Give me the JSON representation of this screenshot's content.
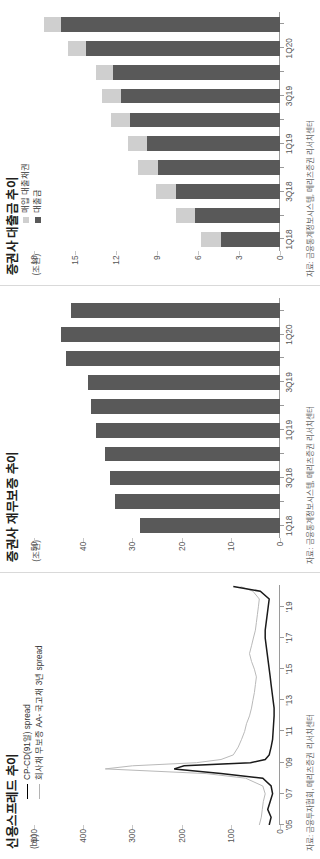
{
  "figure": {
    "orientation": "rotated-90-ccw",
    "colors": {
      "dark_bar": "#595959",
      "light_bar": "#cfcfcf",
      "line_dark": "#1a1a1a",
      "line_light": "#b9b9b9",
      "axis": "#9a9a9a",
      "text": "#231f20"
    }
  },
  "panels": [
    {
      "title": "신용스프레드 추이",
      "unit": "(bp)",
      "source": "자료: 금융투자협회, 메리츠증권 리서치센터",
      "legend": [
        {
          "label": "CP-CD(91일) spread",
          "style": "line-dark"
        },
        {
          "label": "회사채 무보증 AA- 국고채 3년 spread",
          "style": "line-light"
        }
      ]
    },
    {
      "title": "증권사 재무보증 추이",
      "unit": "(조원)",
      "source": "자료: 금융통계정보시스템, 메리츠증권 리서치센터",
      "legend": []
    },
    {
      "title": "증권사 대출금 추이",
      "unit": "(조원)",
      "source": "자료: 금융통계정보시스템, 메리츠증권 리서치센터",
      "legend": [
        {
          "label": "매입 대출채권",
          "style": "sq-light"
        },
        {
          "label": "대출금",
          "style": "sq-dark"
        }
      ]
    }
  ],
  "chart_data": [
    {
      "type": "line",
      "title": "신용스프레드 추이",
      "xlabel": "",
      "ylabel": "bp",
      "ylim": [
        0,
        500
      ],
      "yticks": [
        0,
        100,
        200,
        300,
        400,
        500
      ],
      "xticks": [
        "'05",
        "'07",
        "'09",
        "'11",
        "'13",
        "'15",
        "'17",
        "'19"
      ],
      "grid": false,
      "legend_position": "top-left",
      "x": [
        2005.0,
        2005.5,
        2006.0,
        2006.5,
        2007.0,
        2007.5,
        2008.0,
        2008.3,
        2008.6,
        2008.8,
        2009.0,
        2009.2,
        2009.5,
        2010.0,
        2010.5,
        2011.0,
        2011.5,
        2012.0,
        2012.5,
        2013.0,
        2013.5,
        2014.0,
        2014.5,
        2015.0,
        2015.5,
        2016.0,
        2016.5,
        2017.0,
        2017.5,
        2018.0,
        2018.5,
        2019.0,
        2019.5,
        2020.0,
        2020.3
      ],
      "series": [
        {
          "name": "CP-CD(91일) spread",
          "color": "#1a1a1a",
          "values": [
            22,
            18,
            25,
            20,
            15,
            18,
            35,
            120,
            215,
            195,
            60,
            30,
            22,
            18,
            15,
            14,
            13,
            12,
            12,
            14,
            16,
            18,
            20,
            22,
            24,
            26,
            28,
            30,
            30,
            28,
            26,
            24,
            22,
            40,
            95
          ]
        },
        {
          "name": "회사채 무보증 AA- 국고채 3년 spread",
          "color": "#b9b9b9",
          "values": [
            42,
            38,
            36,
            34,
            30,
            35,
            70,
            150,
            355,
            300,
            170,
            120,
            95,
            85,
            78,
            72,
            68,
            62,
            58,
            55,
            52,
            50,
            48,
            52,
            58,
            62,
            58,
            54,
            50,
            48,
            46,
            44,
            42,
            55,
            80
          ]
        }
      ]
    },
    {
      "type": "bar",
      "title": "증권사 재무보증 추이",
      "xlabel": "",
      "ylabel": "조원",
      "ylim": [
        0,
        50
      ],
      "yticks": [
        0,
        10,
        20,
        30,
        40,
        50
      ],
      "categories": [
        "1Q18",
        "2Q18",
        "3Q18",
        "4Q18",
        "1Q19",
        "2Q19",
        "3Q19",
        "4Q19",
        "1Q20",
        "2Q20"
      ],
      "xticklabels": [
        "1Q18",
        "",
        "3Q18",
        "",
        "1Q19",
        "",
        "3Q19",
        "",
        "1Q20",
        ""
      ],
      "grid": false,
      "series": [
        {
          "name": "재무보증",
          "color": "#595959",
          "values": [
            28.5,
            33.5,
            34.5,
            35.5,
            37.5,
            38.5,
            39.0,
            43.5,
            44.5,
            42.5
          ]
        }
      ]
    },
    {
      "type": "bar",
      "subtype": "stacked",
      "title": "증권사 대출금 추이",
      "xlabel": "",
      "ylabel": "조원",
      "ylim": [
        0,
        18
      ],
      "yticks": [
        0,
        3,
        6,
        9,
        12,
        15,
        18
      ],
      "categories": [
        "1Q18",
        "2Q18",
        "3Q18",
        "4Q18",
        "1Q19",
        "2Q19",
        "3Q19",
        "4Q19",
        "1Q20",
        "2Q20"
      ],
      "xticklabels": [
        "1Q18",
        "",
        "3Q18",
        "",
        "1Q19",
        "",
        "3Q19",
        "",
        "1Q20",
        ""
      ],
      "grid": false,
      "legend_position": "top-left",
      "series": [
        {
          "name": "대출금",
          "color": "#595959",
          "values": [
            4.3,
            6.2,
            7.6,
            8.9,
            9.7,
            11.0,
            11.6,
            12.2,
            14.2,
            16.0
          ]
        },
        {
          "name": "매입 대출채권",
          "color": "#cfcfcf",
          "values": [
            1.5,
            1.4,
            1.5,
            1.5,
            1.4,
            1.4,
            1.4,
            1.3,
            1.3,
            1.3
          ]
        }
      ]
    }
  ]
}
